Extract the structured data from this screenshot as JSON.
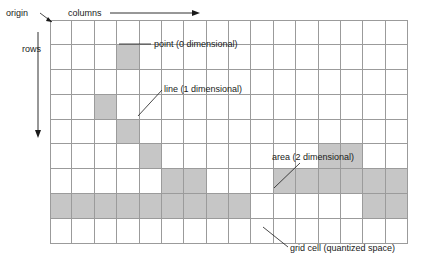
{
  "diagram": {
    "grid": {
      "columns": 16,
      "rows": 9,
      "line_color": "#9b9b9b",
      "fill_color": "#c6c6c6",
      "background_color": "#ffffff"
    },
    "axes": {
      "origin_label": "origin",
      "columns_label": "columns",
      "rows_label": "rows"
    },
    "annotations": {
      "point": "point (0 dimensional)",
      "line": "line (1 dimensional)",
      "area": "area (2 dimensional)",
      "grid_cell": "grid cell (quantized space)"
    }
  },
  "chart_data": {
    "type": "heatmap",
    "title": "grid cell (quantized space)",
    "xlabel": "columns",
    "ylabel": "rows",
    "grid": true,
    "legend_position": "none",
    "ncols": 16,
    "nrows": 9,
    "cell_states": [
      "empty",
      "filled"
    ],
    "filled_cells": [
      [
        1,
        3
      ],
      [
        3,
        2
      ],
      [
        4,
        3
      ],
      [
        5,
        4
      ],
      [
        6,
        5
      ],
      [
        6,
        6
      ],
      [
        5,
        12
      ],
      [
        5,
        13
      ],
      [
        6,
        10
      ],
      [
        6,
        11
      ],
      [
        6,
        12
      ],
      [
        6,
        13
      ],
      [
        6,
        14
      ],
      [
        6,
        15
      ],
      [
        7,
        4
      ],
      [
        7,
        5
      ],
      [
        7,
        6
      ],
      [
        7,
        7
      ],
      [
        7,
        8
      ],
      [
        7,
        0
      ],
      [
        7,
        1
      ],
      [
        7,
        2
      ],
      [
        7,
        3
      ],
      [
        7,
        14
      ],
      [
        7,
        15
      ]
    ],
    "matrix": [
      [
        0,
        0,
        0,
        0,
        0,
        0,
        0,
        0,
        0,
        0,
        0,
        0,
        0,
        0,
        0,
        0
      ],
      [
        0,
        0,
        0,
        1,
        0,
        0,
        0,
        0,
        0,
        0,
        0,
        0,
        0,
        0,
        0,
        0
      ],
      [
        0,
        0,
        0,
        0,
        0,
        0,
        0,
        0,
        0,
        0,
        0,
        0,
        0,
        0,
        0,
        0
      ],
      [
        0,
        0,
        1,
        0,
        0,
        0,
        0,
        0,
        0,
        0,
        0,
        0,
        0,
        0,
        0,
        0
      ],
      [
        0,
        0,
        0,
        1,
        0,
        0,
        0,
        0,
        0,
        0,
        0,
        0,
        0,
        0,
        0,
        0
      ],
      [
        0,
        0,
        0,
        0,
        1,
        0,
        0,
        0,
        0,
        0,
        0,
        0,
        0,
        0,
        0,
        0
      ],
      [
        0,
        0,
        0,
        0,
        0,
        1,
        0,
        0,
        0,
        0,
        0,
        0,
        0,
        0,
        0,
        0
      ],
      [
        0,
        0,
        0,
        0,
        0,
        0,
        1,
        1,
        0,
        0,
        0,
        0,
        0,
        0,
        0,
        0
      ],
      [
        0,
        0,
        0,
        0,
        0,
        0,
        0,
        0,
        0,
        0,
        0,
        0,
        0,
        0,
        0,
        0
      ]
    ],
    "annotations": [
      {
        "text": "point (0 dimensional)",
        "target_row": 1,
        "target_col": 3
      },
      {
        "text": "line (1 dimensional)",
        "target_row": 5,
        "target_col": 5
      },
      {
        "text": "area (2 dimensional)",
        "target_row": 6,
        "target_col": 11
      },
      {
        "text": "grid cell (quantized space)",
        "target_row": 8,
        "target_col": 7
      }
    ]
  }
}
